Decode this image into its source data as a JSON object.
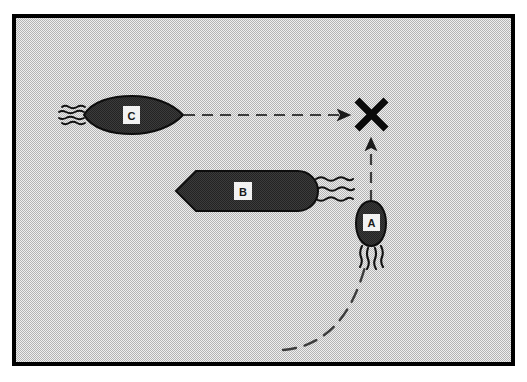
{
  "figure": {
    "domain_kind": "diagram",
    "canvas": {
      "width": 527,
      "height": 382
    },
    "frame": {
      "name": "panel-border",
      "outer_x": 14,
      "outer_y": 16,
      "outer_width": 499,
      "outer_height": 348,
      "border_color": "#000000",
      "border_width": 4,
      "fill_color": "#d9d9d9",
      "fill_style": "halftone-dither-gray",
      "outside_color": "#ffffff"
    },
    "palette": {
      "cell_body": "#3a3a3a",
      "cell_body_light": "#4a4a4a",
      "cell_outline": "#0d0d0d",
      "flagella": "#111111",
      "label_box_fill": "#f2f2f2",
      "label_text": "#1a1a1a",
      "dashed_path": "#3c3c3c",
      "arrow_head": "#1a1a1a",
      "collision_mark": "#0a0a0a",
      "background_gray": "#d9d9d9"
    },
    "cells": [
      {
        "id": "cell-a",
        "label": "A",
        "shape": "small-ovoid-bullet",
        "orientation": "pointing-up",
        "center_x": 371,
        "center_y": 224,
        "body_width": 26,
        "body_height": 46,
        "label_box": {
          "x": 362,
          "y": 214,
          "width": 17,
          "height": 17
        },
        "flagella_count": 4,
        "flagella_side": "bottom",
        "description": "Small cell swimming upward toward the collision point"
      },
      {
        "id": "cell-b",
        "label": "B",
        "shape": "long-rod-pointed-left",
        "orientation": "horizontal",
        "center_x": 248,
        "center_y": 191,
        "body_width": 144,
        "body_height": 40,
        "label_box": {
          "x": 234,
          "y": 182,
          "width": 18,
          "height": 18
        },
        "flagella_count": 3,
        "flagella_side": "right",
        "description": "Large elongated rod cell, stationary in mid-field"
      },
      {
        "id": "cell-c",
        "label": "C",
        "shape": "lens-spindle",
        "orientation": "horizontal",
        "center_x": 132,
        "center_y": 115,
        "body_width": 98,
        "body_height": 36,
        "label_box": {
          "x": 123,
          "y": 107,
          "width": 17,
          "height": 17
        },
        "flagella_count": 4,
        "flagella_side": "left",
        "description": "Spindle-shaped cell swimming rightward toward the collision point"
      }
    ],
    "paths": [
      {
        "id": "path-c-horizontal",
        "name": "trajectory-c",
        "style": "dashed-straight",
        "from_x": 184,
        "from_y": 115,
        "to_x": 351,
        "to_y": 115,
        "arrowhead": "right",
        "arrowhead_x": 353,
        "arrowhead_y": 115,
        "dash_pattern": "11 7"
      },
      {
        "id": "path-a-vertical",
        "name": "trajectory-a",
        "style": "dashed-straight",
        "from_x": 371,
        "from_y": 200,
        "to_x": 371,
        "to_y": 137,
        "arrowhead": "up",
        "arrowhead_x": 371,
        "arrowhead_y": 134,
        "dash_pattern": "11 7"
      },
      {
        "id": "path-a-curve",
        "name": "approach-curve-a",
        "style": "dashed-curve",
        "from_x": 283,
        "from_y": 349,
        "to_x": 366,
        "to_y": 262,
        "curve_control_x": 348,
        "curve_control_y": 344,
        "dash_pattern": "13 9"
      }
    ],
    "collision_mark": {
      "id": "collision-x",
      "name": "collision-x-mark",
      "symbol": "X",
      "center_x": 371,
      "center_y": 114,
      "size": 30,
      "stroke_width": 7,
      "color": "#0a0a0a",
      "description": "Bold X marking the predicted collision / encounter point"
    }
  }
}
